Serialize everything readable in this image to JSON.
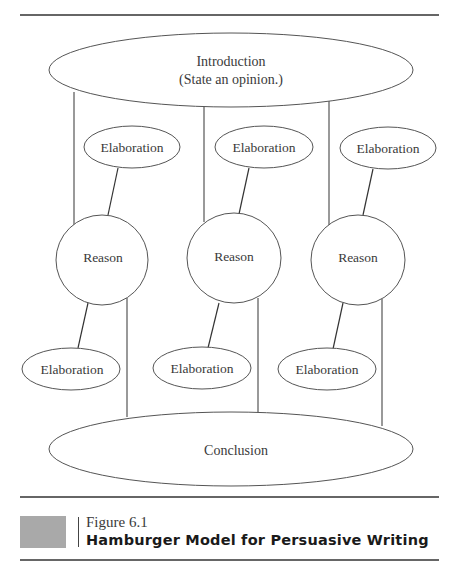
{
  "colors": {
    "stroke": "#555555",
    "rule": "#333333",
    "text": "#3a3a3a",
    "caption_box": "#a9a9a9"
  },
  "diagram": {
    "introduction": {
      "line1": "Introduction",
      "line2": "(State an opinion.)"
    },
    "top_elaborations": [
      "Elaboration",
      "Elaboration",
      "Elaboration"
    ],
    "reasons": [
      "Reason",
      "Reason",
      "Reason"
    ],
    "bottom_elaborations": [
      "Elaboration",
      "Elaboration",
      "Elaboration"
    ],
    "conclusion": "Conclusion"
  },
  "caption": {
    "figure_number": "Figure 6.1",
    "title": "Hamburger Model for Persuasive Writing"
  }
}
